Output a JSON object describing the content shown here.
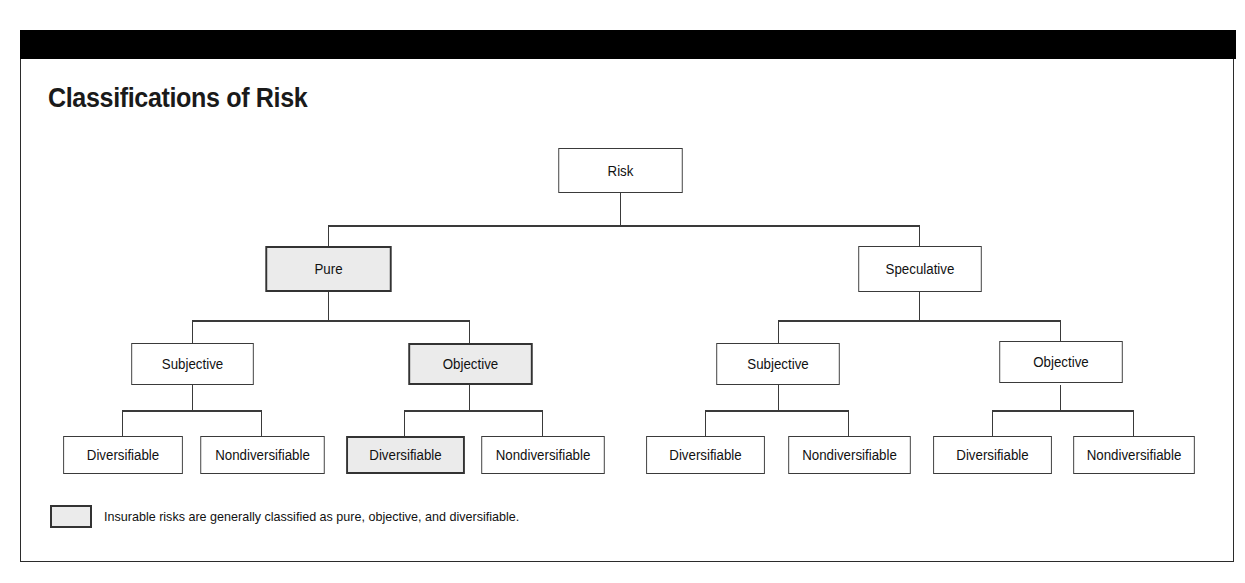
{
  "figure": {
    "title": "Classifications of Risk",
    "header_bar_color": "#000000",
    "frame_border_color": "#2b2b2b",
    "shade_color": "#ebebeb",
    "line_color": "#3a3a3a",
    "background_color": "#ffffff"
  },
  "tree": {
    "root": {
      "label": "Risk",
      "shaded": false
    },
    "level1": [
      {
        "label": "Pure",
        "shaded": true
      },
      {
        "label": "Speculative",
        "shaded": false
      }
    ],
    "level2": [
      {
        "label": "Subjective",
        "shaded": false
      },
      {
        "label": "Objective",
        "shaded": true
      },
      {
        "label": "Subjective",
        "shaded": false
      },
      {
        "label": "Objective",
        "shaded": false
      }
    ],
    "level3": [
      {
        "label": "Diversifiable",
        "shaded": false
      },
      {
        "label": "Nondiversifiable",
        "shaded": false
      },
      {
        "label": "Diversifiable",
        "shaded": true
      },
      {
        "label": "Nondiversifiable",
        "shaded": false
      },
      {
        "label": "Diversifiable",
        "shaded": false
      },
      {
        "label": "Nondiversifiable",
        "shaded": false
      },
      {
        "label": "Diversifiable",
        "shaded": false
      },
      {
        "label": "Nondiversifiable",
        "shaded": false
      }
    ]
  },
  "legend": {
    "swatch_shaded": true,
    "text": "Insurable risks are generally classified as pure, objective, and diversifiable."
  }
}
